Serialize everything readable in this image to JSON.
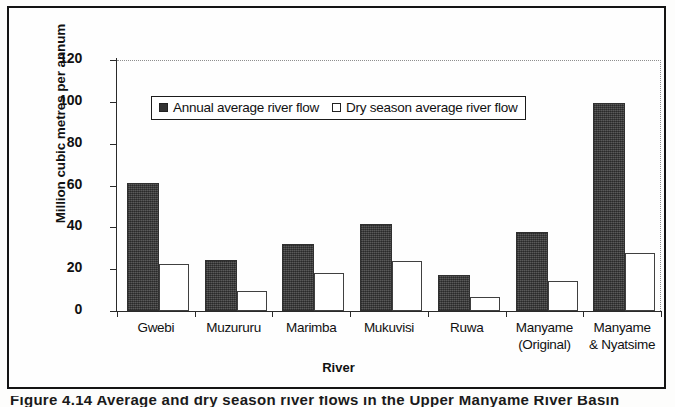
{
  "figure": {
    "caption_partial": "Figure 4.14 Average and dry season river flows in the Upper Manyame River Basin"
  },
  "chart_data": {
    "type": "bar",
    "title": "",
    "xlabel": "River",
    "ylabel": "Million cubic metres per annum",
    "ylim": [
      0,
      120
    ],
    "yticks": [
      0,
      20,
      40,
      60,
      80,
      100,
      120
    ],
    "grid": false,
    "legend_position": "upper-left-inside",
    "categories": [
      "Gwebi",
      "Muzururu",
      "Marimba",
      "Mukuvisi",
      "Ruwa",
      "Manyame (Original)",
      "Manyame & Nyatsime"
    ],
    "category_lines": [
      [
        "Gwebi"
      ],
      [
        "Muzururu"
      ],
      [
        "Marimba"
      ],
      [
        "Mukuvisi"
      ],
      [
        "Ruwa"
      ],
      [
        "Manyame",
        "(Original)"
      ],
      [
        "Manyame",
        "& Nyatsime"
      ]
    ],
    "series": [
      {
        "name": "Annual average river flow",
        "color": "#4a4a4a",
        "values": [
          61,
          24.5,
          32,
          41.5,
          17,
          38,
          99.5
        ]
      },
      {
        "name": "Dry season average river flow",
        "color": "#ffffff",
        "values": [
          22.5,
          9.5,
          18,
          24,
          6.5,
          14.5,
          27.5
        ]
      }
    ]
  },
  "axis": {
    "y_tick_labels": [
      "120",
      "100",
      "80",
      "60",
      "40",
      "20",
      "0"
    ]
  }
}
